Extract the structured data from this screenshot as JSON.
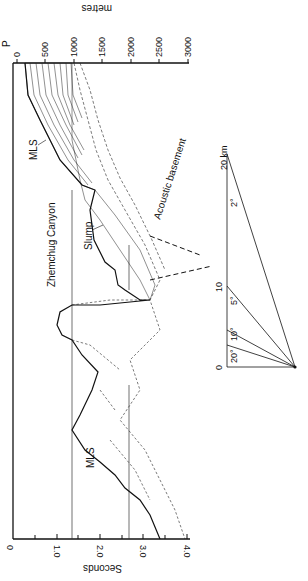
{
  "figure": {
    "profile_label": "P",
    "metres_axis": {
      "title": "metres",
      "ticks": [
        "0",
        "500",
        "1000",
        "1500",
        "2000",
        "2500",
        "3000"
      ]
    },
    "seconds_axis": {
      "title": "Seconds",
      "ticks": [
        "0",
        "1.0",
        "2.0",
        "3.0",
        "4.0"
      ]
    },
    "annotations": {
      "mls_upper": "MLS",
      "mls_lower": "MLS",
      "canyon": "Zhemchug Canyon",
      "slump": "Slump",
      "basement": "Acoustic basement"
    },
    "slope_scale": {
      "distance_labels": [
        "0",
        "10",
        "20 km"
      ],
      "angle_labels": [
        "20°",
        "10°",
        "5°",
        "2°"
      ]
    }
  },
  "colors": {
    "ink": "#111111",
    "background": "#ffffff"
  }
}
